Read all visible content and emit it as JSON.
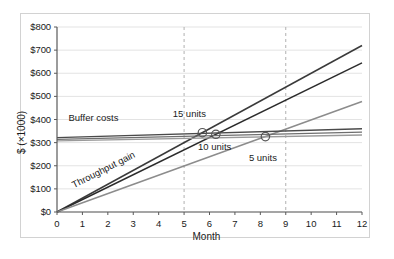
{
  "chart_data": {
    "type": "line",
    "title": "",
    "xlabel": "Month",
    "ylabel": "$ (×1000)",
    "xlim": [
      0,
      12
    ],
    "ylim": [
      0,
      800
    ],
    "grid": true,
    "legend": "none",
    "x_ticks": [
      "0",
      "1",
      "2",
      "3",
      "4",
      "5",
      "6",
      "7",
      "8",
      "9",
      "10",
      "11",
      "12"
    ],
    "y_ticks": [
      "$0",
      "$100",
      "$200",
      "$300",
      "$400",
      "$500",
      "$600",
      "$700",
      "$800"
    ],
    "x_tick_values": [
      0,
      1,
      2,
      3,
      4,
      5,
      6,
      7,
      8,
      9,
      10,
      11,
      12
    ],
    "y_tick_values": [
      0,
      100,
      200,
      300,
      400,
      500,
      600,
      700,
      800
    ],
    "series": [
      {
        "name": "Throughput gain 15 units",
        "group": "throughput",
        "x": [
          0,
          12
        ],
        "values": [
          0,
          720
        ],
        "color": "#3a3a3a"
      },
      {
        "name": "Throughput gain 10 units",
        "group": "throughput",
        "x": [
          0,
          12
        ],
        "values": [
          0,
          645
        ],
        "color": "#2b2b2b"
      },
      {
        "name": "Throughput gain 5 units",
        "group": "throughput",
        "x": [
          0,
          12
        ],
        "values": [
          0,
          478
        ],
        "color": "#8c8c8c"
      },
      {
        "name": "Buffer costs 15 units",
        "group": "buffer",
        "x": [
          0,
          12
        ],
        "values": [
          322,
          360
        ],
        "color": "#4a4a4a"
      },
      {
        "name": "Buffer costs 10 units",
        "group": "buffer",
        "x": [
          0,
          12
        ],
        "values": [
          314,
          345
        ],
        "color": "#6e6e6e"
      },
      {
        "name": "Buffer costs 5 units",
        "group": "buffer",
        "x": [
          0,
          12
        ],
        "values": [
          308,
          333
        ],
        "color": "#9a9a9a"
      }
    ],
    "markers": [
      {
        "label": "15 units breakeven",
        "x": 5.72,
        "y": 343
      },
      {
        "label": "10 units breakeven",
        "x": 6.25,
        "y": 336
      },
      {
        "label": "5 units breakeven",
        "x": 8.2,
        "y": 326
      }
    ],
    "reference_lines": [
      {
        "axis": "x",
        "value": 5,
        "style": "dashed",
        "color": "#b0b0b0"
      },
      {
        "axis": "x",
        "value": 9,
        "style": "dashed",
        "color": "#b0b0b0"
      }
    ],
    "annotations": [
      {
        "name": "buffer-costs",
        "text": "Buffer costs",
        "x": 0.45,
        "y": 408,
        "rotation": 0
      },
      {
        "name": "throughput-gain",
        "text": "Throughput gain",
        "x": 0.7,
        "y": 115,
        "rotation": -27
      },
      {
        "name": "units-15",
        "text": "15 units",
        "x": 4.55,
        "y": 425,
        "rotation": 0
      },
      {
        "name": "units-10",
        "text": "10 units",
        "x": 5.55,
        "y": 283,
        "rotation": 0
      },
      {
        "name": "units-5",
        "text": "5 units",
        "x": 7.55,
        "y": 232,
        "rotation": 0
      }
    ],
    "colors": {
      "grid": "#e3e3e3",
      "axis": "#5a5a5a",
      "frame": "#d2d2d2",
      "background": "#ffffff",
      "marker_stroke": "#555555",
      "dashed_reference": "#b0b0b0"
    }
  }
}
